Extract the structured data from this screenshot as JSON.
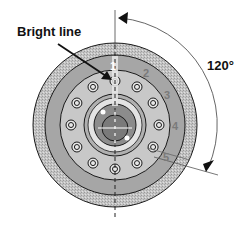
{
  "diagram": {
    "annotation_label": "Bright line",
    "angle_label": "120°",
    "position_labels": [
      "1",
      "2",
      "3",
      "4",
      "5"
    ],
    "colors": {
      "outer_ring": "#b8b8b8",
      "middle_ring": "#a6a6a6",
      "bolt_ring": "#c8c8c8",
      "hub_light": "#d9d9d9",
      "hub_dark": "#8c8c8c",
      "label_gray": "#7a7a7a",
      "outline": "#1a1a1a"
    }
  }
}
